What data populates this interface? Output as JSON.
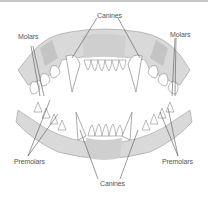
{
  "diagram": {
    "colors": {
      "bone": "#d9d9d9",
      "bone_dark": "#c4c4c4",
      "tooth": "#ffffff",
      "outline": "#8a8a8a",
      "leader_line": "#555555",
      "label_text": "#555555"
    },
    "labels": {
      "canines_top": "Canines",
      "molars_left": "Molars",
      "molars_right": "Molars",
      "premolars_left": "Premolars",
      "premolars_right": "Premolars",
      "canines_bottom": "Canines"
    }
  }
}
